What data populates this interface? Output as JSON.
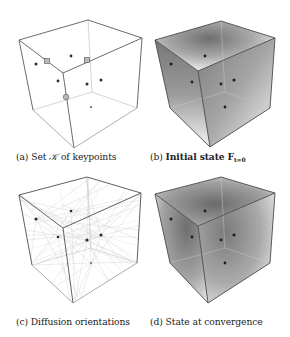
{
  "figure": {
    "panels": [
      {
        "id": "a",
        "label": "(a)",
        "caption_prefix": "Set",
        "caption_symbol": "𝒦",
        "caption_suffix": "of keypoints",
        "cube": {
          "tl": [
            19,
            40
          ],
          "tb": [
            88,
            20
          ],
          "tr": [
            142,
            38
          ],
          "ft": [
            63,
            73
          ],
          "fb": [
            74,
            148
          ],
          "bl": [
            33,
            110
          ],
          "br": [
            137,
            108
          ]
        },
        "keypoints": [
          [
            36,
            64
          ],
          [
            71,
            56
          ],
          [
            58,
            81
          ],
          [
            87,
            84
          ],
          [
            101,
            80
          ],
          [
            91,
            107
          ]
        ],
        "square_markers": [
          [
            47,
            61
          ],
          [
            87,
            60
          ]
        ],
        "ring_markers": [
          [
            66,
            97
          ]
        ]
      },
      {
        "id": "b",
        "label": "(b)",
        "caption_text": "Initial state",
        "caption_math": "F",
        "caption_sub": "t=0",
        "cube": {
          "tl": [
            155,
            40
          ],
          "tb": [
            221,
            21
          ],
          "tr": [
            275,
            38
          ],
          "ft": [
            198,
            71
          ],
          "fb": [
            210,
            147
          ],
          "bl": [
            170,
            108
          ],
          "br": [
            270,
            108
          ]
        },
        "keypoints": [
          [
            171,
            64
          ],
          [
            205,
            56
          ],
          [
            192,
            82
          ],
          [
            221,
            84
          ],
          [
            234,
            80
          ],
          [
            225,
            107
          ]
        ]
      },
      {
        "id": "c",
        "label": "(c)",
        "caption_text": "Diffusion orientations",
        "cube": {
          "tl": [
            19,
            195
          ],
          "tb": [
            87,
            177
          ],
          "tr": [
            141,
            193
          ],
          "ft": [
            63,
            228
          ],
          "fb": [
            73,
            303
          ],
          "bl": [
            32,
            265
          ],
          "br": [
            137,
            263
          ]
        },
        "keypoints": [
          [
            36,
            219
          ],
          [
            71,
            211
          ],
          [
            58,
            237
          ],
          [
            87,
            240
          ],
          [
            101,
            235
          ],
          [
            91,
            263
          ]
        ]
      },
      {
        "id": "d",
        "label": "(d)",
        "caption_text": "State at convergence",
        "cube": {
          "tl": [
            155,
            194
          ],
          "tb": [
            221,
            177
          ],
          "tr": [
            275,
            193
          ],
          "ft": [
            198,
            226
          ],
          "fb": [
            208,
            303
          ],
          "bl": [
            170,
            263
          ],
          "br": [
            270,
            263
          ]
        },
        "keypoints": [
          [
            171,
            219
          ],
          [
            205,
            211
          ],
          [
            192,
            237
          ],
          [
            221,
            240
          ],
          [
            234,
            235
          ],
          [
            225,
            263
          ]
        ]
      }
    ],
    "colors": {
      "edge_front": "#555555",
      "edge_back": "#b5b5b5",
      "keypoint": "#333333",
      "shading_dark": "#6a6a6a",
      "shading_light": "#f4f4f4"
    }
  }
}
